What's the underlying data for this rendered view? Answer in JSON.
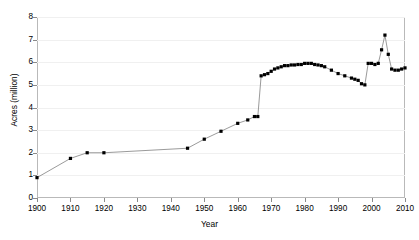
{
  "chart_data": {
    "type": "line",
    "title": "",
    "subtitle": "",
    "xlabel": "Year",
    "ylabel": "Acres (million)",
    "xlim": [
      1900,
      2010
    ],
    "ylim": [
      0,
      8
    ],
    "xticks": [
      1900,
      1910,
      1920,
      1930,
      1940,
      1950,
      1960,
      1970,
      1980,
      1990,
      2000,
      2010
    ],
    "yticks": [
      0,
      1,
      2,
      3,
      4,
      5,
      6,
      7,
      8
    ],
    "grid": "horizontal",
    "legend": "none",
    "marker": "square",
    "marker_color": "#000000",
    "line_color": "#808080",
    "series": [
      {
        "name": "Acres",
        "x": [
          1900,
          1910,
          1915,
          1920,
          1945,
          1950,
          1955,
          1960,
          1963,
          1965,
          1966,
          1967,
          1968,
          1969,
          1970,
          1971,
          1972,
          1973,
          1974,
          1975,
          1976,
          1977,
          1978,
          1979,
          1980,
          1981,
          1982,
          1983,
          1984,
          1985,
          1986,
          1988,
          1990,
          1992,
          1994,
          1995,
          1996,
          1997,
          1998,
          1999,
          2000,
          2001,
          2002,
          2003,
          2004,
          2005,
          2006,
          2007,
          2008,
          2009,
          2010
        ],
        "y": [
          0.9,
          1.75,
          2.0,
          2.0,
          2.2,
          2.6,
          2.95,
          3.3,
          3.45,
          3.6,
          3.6,
          5.4,
          5.45,
          5.5,
          5.6,
          5.7,
          5.75,
          5.8,
          5.85,
          5.85,
          5.88,
          5.88,
          5.9,
          5.9,
          5.95,
          5.95,
          5.95,
          5.9,
          5.88,
          5.85,
          5.8,
          5.65,
          5.5,
          5.4,
          5.3,
          5.25,
          5.2,
          5.05,
          5.0,
          5.95,
          5.95,
          5.9,
          5.95,
          6.55,
          7.2,
          6.35,
          5.7,
          5.65,
          5.65,
          5.7,
          5.75
        ]
      }
    ]
  },
  "axes": {
    "y_label": "Acres (million)",
    "x_label": "Year",
    "y_tick_labels": [
      "8",
      "7",
      "6",
      "5",
      "4",
      "3",
      "2",
      "1",
      "0"
    ],
    "x_tick_labels": [
      "1900",
      "1910",
      "1920",
      "1930",
      "1940",
      "1950",
      "1960",
      "1970",
      "1980",
      "1990",
      "2000",
      "2010"
    ]
  },
  "title": {
    "text": ""
  }
}
